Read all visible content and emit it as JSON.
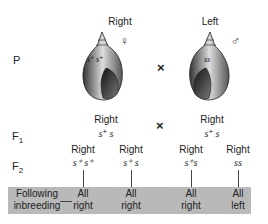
{
  "parents": {
    "row_label": "P",
    "female": {
      "phenotype": "Right",
      "genotype": "s+ s+",
      "sex_symbol": "♀",
      "icon": "dextral-snail-shell-icon"
    },
    "cross_symbol": "×",
    "male": {
      "phenotype": "Left",
      "genotype": "ss",
      "sex_symbol": "♂",
      "icon": "sinistral-snail-shell-icon"
    }
  },
  "f1": {
    "row_label": "F",
    "row_sub": "1",
    "left": {
      "phenotype": "Right",
      "g1": "s",
      "g1sup": "+",
      "g2": " s"
    },
    "cross_symbol": "×",
    "right": {
      "phenotype": "Right",
      "g1": "s",
      "g1sup": "+",
      "g2": " s"
    }
  },
  "f2": {
    "row_label": "F",
    "row_sub": "2",
    "items": [
      {
        "phenotype": "Right",
        "genotype_html": "s⁺ s⁺",
        "outcome_line1": "All",
        "outcome_line2": "right"
      },
      {
        "phenotype": "Right",
        "genotype_html": "s⁺ s",
        "outcome_line1": "All",
        "outcome_line2": "right"
      },
      {
        "phenotype": "Right",
        "genotype_html": "s⁺s",
        "outcome_line1": "All",
        "outcome_line2": "right"
      },
      {
        "phenotype": "Right",
        "genotype_html": "ss",
        "outcome_line1": "All",
        "outcome_line2": "left"
      }
    ]
  },
  "band": {
    "label_line1": "Following",
    "label_line2": "inbreeding",
    "color": "#b9b9b9"
  }
}
